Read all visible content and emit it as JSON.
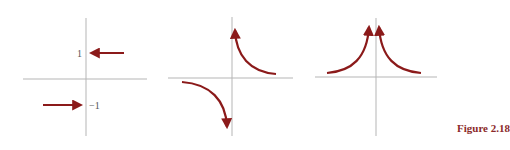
{
  "caption": "Figure 2.18",
  "colors": {
    "axis": "#b5b5b5",
    "curve": "#8b1a1a",
    "caption": "#8b2a2a",
    "label": "#555555"
  },
  "panels": [
    {
      "id": "horizontal-asymptotes",
      "labels": {
        "upper": "1",
        "lower": "−1"
      }
    },
    {
      "id": "odd-vertical-asymptote"
    },
    {
      "id": "even-vertical-asymptote"
    }
  ]
}
